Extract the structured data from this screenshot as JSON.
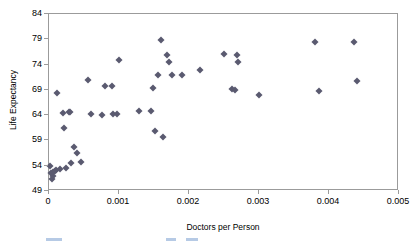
{
  "chart_data": {
    "type": "scatter",
    "title": "",
    "xlabel": "Doctors per Person",
    "ylabel": "Life Expectancy",
    "xlim": [
      0,
      0.005
    ],
    "ylim": [
      49,
      84
    ],
    "xticks": [
      "0",
      "0.001",
      "0.002",
      "0.003",
      "0.004",
      "0.005"
    ],
    "xtick_values": [
      0,
      0.001,
      0.002,
      0.003,
      0.004,
      0.005
    ],
    "yticks": [
      "49",
      "54",
      "59",
      "64",
      "69",
      "74",
      "79",
      "84"
    ],
    "ytick_values": [
      49,
      54,
      59,
      64,
      69,
      74,
      79,
      84
    ],
    "grid": false,
    "legend": false,
    "marker_shape": "diamond",
    "marker_color": "#5a5a70",
    "frame_color": "#9b9b9b",
    "points": [
      {
        "x": 2e-05,
        "y": 53.9
      },
      {
        "x": 3e-05,
        "y": 52.6
      },
      {
        "x": 4e-05,
        "y": 51.4
      },
      {
        "x": 5e-05,
        "y": 52.0
      },
      {
        "x": 6e-05,
        "y": 52.8
      },
      {
        "x": 8e-05,
        "y": 53.0
      },
      {
        "x": 0.0001,
        "y": 53.2
      },
      {
        "x": 0.00012,
        "y": 68.4
      },
      {
        "x": 0.00016,
        "y": 53.3
      },
      {
        "x": 0.0002,
        "y": 64.5
      },
      {
        "x": 0.00022,
        "y": 61.4
      },
      {
        "x": 0.00024,
        "y": 53.6
      },
      {
        "x": 0.00028,
        "y": 64.7
      },
      {
        "x": 0.0003,
        "y": 64.7
      },
      {
        "x": 0.00031,
        "y": 54.5
      },
      {
        "x": 0.00036,
        "y": 57.7
      },
      {
        "x": 0.0004,
        "y": 56.5
      },
      {
        "x": 0.00046,
        "y": 54.8
      },
      {
        "x": 0.00056,
        "y": 71.0
      },
      {
        "x": 0.0006,
        "y": 64.2
      },
      {
        "x": 0.00075,
        "y": 64.0
      },
      {
        "x": 0.0008,
        "y": 69.7
      },
      {
        "x": 0.0009,
        "y": 69.7
      },
      {
        "x": 0.00092,
        "y": 64.3
      },
      {
        "x": 0.00097,
        "y": 64.3
      },
      {
        "x": 0.001,
        "y": 75.0
      },
      {
        "x": 0.00128,
        "y": 64.8
      },
      {
        "x": 0.00145,
        "y": 64.8
      },
      {
        "x": 0.00148,
        "y": 69.4
      },
      {
        "x": 0.00152,
        "y": 60.8
      },
      {
        "x": 0.00155,
        "y": 72.0
      },
      {
        "x": 0.0016,
        "y": 78.9
      },
      {
        "x": 0.00163,
        "y": 59.6
      },
      {
        "x": 0.00168,
        "y": 75.8
      },
      {
        "x": 0.00172,
        "y": 74.5
      },
      {
        "x": 0.00175,
        "y": 71.9
      },
      {
        "x": 0.0019,
        "y": 71.9
      },
      {
        "x": 0.00215,
        "y": 73.0
      },
      {
        "x": 0.0025,
        "y": 76.0
      },
      {
        "x": 0.00262,
        "y": 69.2
      },
      {
        "x": 0.00265,
        "y": 68.9
      },
      {
        "x": 0.00268,
        "y": 75.9
      },
      {
        "x": 0.0027,
        "y": 74.6
      },
      {
        "x": 0.003,
        "y": 68.0
      },
      {
        "x": 0.0038,
        "y": 78.5
      },
      {
        "x": 0.00385,
        "y": 68.8
      },
      {
        "x": 0.00435,
        "y": 78.5
      },
      {
        "x": 0.0044,
        "y": 70.7
      }
    ]
  },
  "legend_strip": {
    "swatches": [
      {
        "left": 46,
        "width": 16
      },
      {
        "left": 166,
        "width": 10
      },
      {
        "left": 186,
        "width": 12
      }
    ]
  }
}
